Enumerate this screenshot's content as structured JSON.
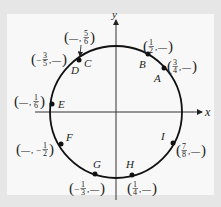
{
  "diagram": {
    "type": "unit-circle",
    "axes": {
      "x_label": "x",
      "y_label": "y"
    },
    "colors": {
      "background": "#e6e6e6",
      "panel": "#f8f8f8",
      "ink": "#222222"
    },
    "points": [
      {
        "name": "A",
        "coord": {
          "x": "3/4",
          "y": "—"
        }
      },
      {
        "name": "B",
        "coord": {
          "x": "1/2",
          "y": "—"
        }
      },
      {
        "name": "C",
        "coord": {
          "x": "—",
          "y": "5/6"
        }
      },
      {
        "name": "D",
        "coord": {
          "x": "−3/5",
          "y": "—"
        }
      },
      {
        "name": "E",
        "coord": {
          "x": "—",
          "y": "1/6"
        }
      },
      {
        "name": "F",
        "coord": {
          "x": "—",
          "y": "−1/2"
        }
      },
      {
        "name": "G",
        "coord": {
          "x": "−1/3",
          "y": "—"
        }
      },
      {
        "name": "H",
        "coord": {
          "x": "1/4",
          "y": "—"
        }
      },
      {
        "name": "I",
        "coord": {
          "x": "7/8",
          "y": "—"
        }
      }
    ],
    "fractions": {
      "A": {
        "sign": "",
        "num": "3",
        "den": "4"
      },
      "B": {
        "sign": "",
        "num": "1",
        "den": "2"
      },
      "C": {
        "sign": "",
        "num": "5",
        "den": "6"
      },
      "D": {
        "sign": "−",
        "num": "3",
        "den": "5"
      },
      "E": {
        "sign": "",
        "num": "1",
        "den": "6"
      },
      "F": {
        "sign": "−",
        "num": "1",
        "den": "2"
      },
      "G": {
        "sign": "−",
        "num": "1",
        "den": "3"
      },
      "H": {
        "sign": "",
        "num": "1",
        "den": "4"
      },
      "I": {
        "sign": "",
        "num": "7",
        "den": "8"
      }
    },
    "blank": "—"
  }
}
